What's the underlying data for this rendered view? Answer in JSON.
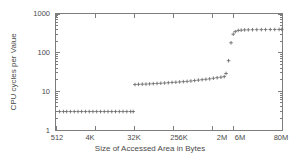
{
  "chart_data": {
    "type": "scatter",
    "title": "",
    "xlabel": "Size of Accessed Area in Bytes",
    "ylabel": "CPU cycles per Value",
    "xscale": "log",
    "yscale": "log",
    "grid": false,
    "legend": false,
    "marker": "plus",
    "marker_color": "#6f6f6f",
    "xlim": [
      512,
      83886080
    ],
    "ylim": [
      1,
      1000
    ],
    "xtick_labels": [
      "512",
      "4K",
      "32K",
      "256K",
      "2M",
      "6M",
      "80M"
    ],
    "xtick_values": [
      512,
      4096,
      32768,
      262144,
      2097152,
      6291456,
      83886080
    ],
    "ytick_labels": [
      "1",
      "10",
      "100",
      "1000"
    ],
    "ytick_values": [
      1,
      10,
      100,
      1000
    ],
    "series": [
      {
        "name": "cpu-cycles-per-value",
        "x": [
          620,
          760,
          900,
          1100,
          1350,
          1650,
          2000,
          2450,
          3000,
          3650,
          4450,
          5450,
          6650,
          8100,
          9900,
          12100,
          14800,
          18000,
          22000,
          27000,
          31000,
          34000,
          41000,
          50000,
          61000,
          74000,
          90000,
          110000,
          134000,
          164000,
          200000,
          244000,
          298000,
          364000,
          444000,
          542000,
          662000,
          808000,
          986000,
          1204000,
          1470000,
          1794000,
          2190000,
          2674000,
          3264000,
          3900000,
          4300000,
          4900000,
          5600000,
          6300000,
          7000000,
          8200000,
          9600000,
          11500000,
          14000000,
          17500000,
          22000000,
          28000000,
          35000000,
          45000000,
          57000000,
          72000000,
          83000000
        ],
        "y": [
          3.0,
          3.0,
          3.0,
          3.0,
          3.0,
          3.0,
          3.0,
          3.0,
          3.0,
          3.0,
          3.0,
          3.0,
          3.0,
          3.0,
          3.0,
          3.0,
          3.0,
          3.0,
          3.0,
          3.0,
          3.0,
          15.0,
          15.2,
          15.3,
          15.4,
          15.6,
          15.8,
          16.0,
          16.2,
          16.4,
          16.7,
          17.0,
          17.2,
          17.5,
          17.8,
          18.1,
          18.5,
          19.0,
          19.5,
          20.0,
          20.5,
          21.0,
          21.8,
          22.5,
          23.2,
          24.0,
          29.0,
          62.0,
          180.0,
          300.0,
          350.0,
          375.0,
          382.0,
          388.0,
          390.0,
          392.0,
          394.0,
          395.0,
          396.0,
          397.0,
          398.0,
          399.0,
          400.0
        ],
        "plateaus": [
          {
            "label": "L1 cache",
            "cycles": 3
          },
          {
            "label": "L2 cache",
            "cycles": 15
          },
          {
            "label": "main memory",
            "cycles": 390
          }
        ]
      }
    ]
  },
  "figure": {
    "frame_color": "#7d7d7d",
    "text_color": "#4a4a4a",
    "background": "#ffffff"
  }
}
